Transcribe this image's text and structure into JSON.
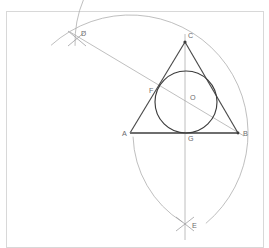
{
  "document": {
    "title": "Triangle Incircle Compass-and-Straightedge Construction",
    "canvas_width": 269,
    "canvas_height": 248,
    "background_color": "#ffffff"
  },
  "frame": {
    "x": 6,
    "y": 11,
    "width": 257,
    "height": 236,
    "stroke_color": "#d8d8d8"
  },
  "colors": {
    "construction": "#a9a9aa",
    "triangle": "#4a4a4a",
    "base": "#6e6e6e",
    "circle": "#3c3c3c",
    "label": "#6b6b6e"
  },
  "points": [
    {
      "id": "A",
      "label": "A",
      "x": 130,
      "y": 133,
      "label_x": 122,
      "label_y": 136,
      "role": "triangle-vertex"
    },
    {
      "id": "B",
      "label": "B",
      "x": 238,
      "y": 133,
      "label_x": 243,
      "label_y": 136,
      "role": "triangle-vertex"
    },
    {
      "id": "C",
      "label": "C",
      "x": 185,
      "y": 42,
      "label_x": 188,
      "label_y": 38,
      "role": "triangle-apex"
    },
    {
      "id": "D",
      "label": "D",
      "x": 77,
      "y": 38,
      "label_x": 81,
      "label_y": 36,
      "role": "arc-intersection"
    },
    {
      "id": "E",
      "label": "E",
      "x": 185,
      "y": 224,
      "label_x": 192,
      "label_y": 228,
      "role": "arc-intersection"
    },
    {
      "id": "F",
      "label": "F",
      "x": 157,
      "y": 95,
      "label_x": 149,
      "label_y": 93,
      "role": "tangent-point"
    },
    {
      "id": "O",
      "label": "O",
      "x": 186,
      "y": 102,
      "label_x": 190,
      "label_y": 100,
      "role": "incenter"
    },
    {
      "id": "G",
      "label": "G",
      "x": 185,
      "y": 133,
      "label_x": 188,
      "label_y": 141,
      "role": "foot-of-altitude"
    }
  ],
  "triangle": {
    "name": "ABC",
    "sides": [
      {
        "name": "side-AC",
        "from": "A",
        "to": "C"
      },
      {
        "name": "side-CB",
        "from": "C",
        "to": "B"
      },
      {
        "name": "side-AB",
        "from": "A",
        "to": "B"
      }
    ]
  },
  "incircle": {
    "center_x": 186,
    "center_y": 102,
    "radius": 31
  },
  "lines": [
    {
      "name": "line-D-B",
      "x1": 70,
      "y1": 32,
      "x2": 244,
      "y2": 136
    },
    {
      "name": "line-C-E-vertical",
      "x1": 185,
      "y1": 34,
      "x2": 185,
      "y2": 240
    }
  ],
  "arcs": [
    {
      "name": "arc-major-A",
      "center_x": 130,
      "center_y": 133,
      "radius": 118,
      "start_deg": 228,
      "end_deg": 50
    },
    {
      "name": "arc-from-D",
      "center_x": 185,
      "center_y": 42,
      "radius": 110,
      "start_deg": 178,
      "end_deg": 228
    },
    {
      "name": "arc-to-E",
      "center_x": 238,
      "center_y": 133,
      "radius": 105,
      "start_deg": 122,
      "end_deg": 178
    }
  ],
  "tick_marks": [
    {
      "name": "tick-D-1",
      "x1": 68,
      "y1": 31,
      "x2": 86,
      "y2": 46
    },
    {
      "name": "tick-D-2",
      "x1": 86,
      "y1": 31,
      "x2": 68,
      "y2": 46
    },
    {
      "name": "tick-E-1",
      "x1": 176,
      "y1": 217,
      "x2": 194,
      "y2": 231
    },
    {
      "name": "tick-E-2",
      "x1": 194,
      "y1": 217,
      "x2": 176,
      "y2": 231
    }
  ]
}
